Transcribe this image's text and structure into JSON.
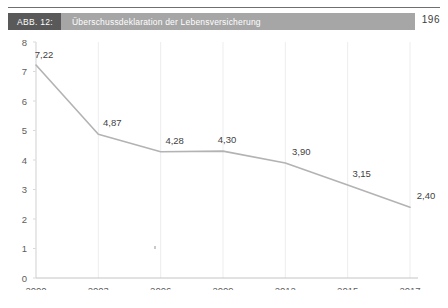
{
  "caption": {
    "id_label": "ABB. 12:",
    "title": "Überschussdeklaration der Lebensversicherung",
    "id_bg": "#595959",
    "title_bg": "#a6a6a6"
  },
  "page_number": "196",
  "chart_data": {
    "type": "line",
    "title": "Überschussdeklaration der Lebensversicherung",
    "categories": [
      "2000",
      "2003",
      "2006",
      "2009",
      "2012",
      "2015",
      "2017"
    ],
    "values": [
      7.22,
      4.87,
      4.28,
      4.3,
      3.9,
      3.15,
      2.4
    ],
    "data_labels": [
      "7,22",
      "4,87",
      "4,28",
      "4,30",
      "3,90",
      "3,15",
      "2,40"
    ],
    "yticks": [
      "0",
      "1",
      "2",
      "3",
      "4",
      "5",
      "6",
      "7",
      "8"
    ],
    "ylim": [
      0,
      8
    ],
    "xlabel": "",
    "ylabel": "",
    "grid": "vertical-only",
    "legend": "none",
    "line_color": "#b3b3b3",
    "gridline_color": "#ededed",
    "axis_color": "#d9d9d9"
  }
}
